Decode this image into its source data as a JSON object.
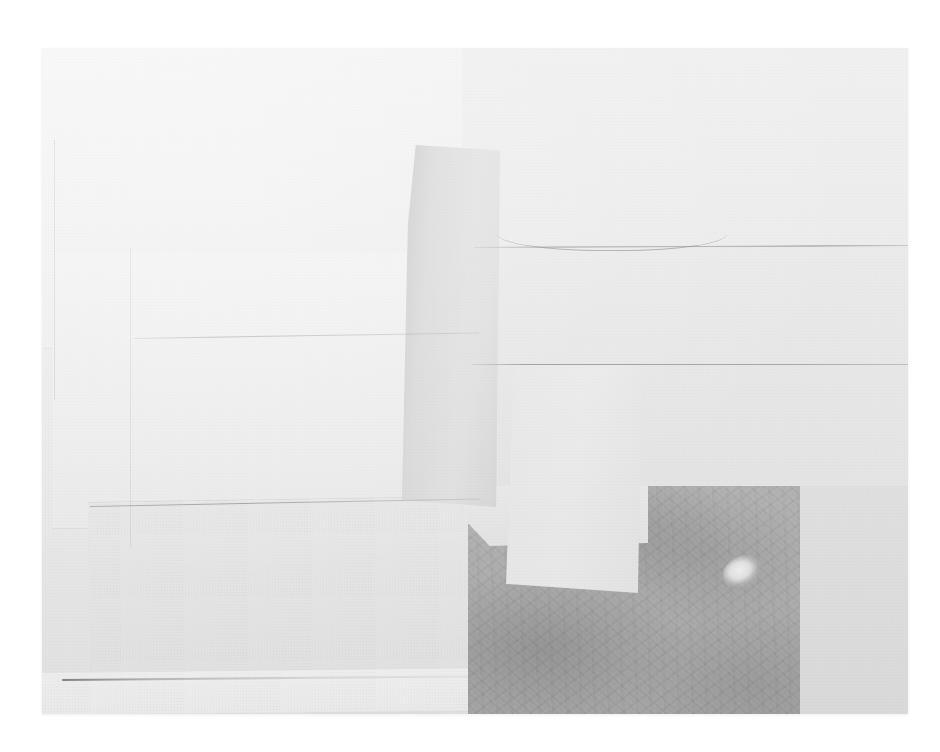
{
  "image": {
    "kind": "photograph-of-artwork",
    "subject": "abstract paper collage",
    "title": "",
    "caption": "",
    "visible_text": "",
    "background_color": "#ffffff",
    "plate": {
      "x": 42,
      "y": 48,
      "width": 866,
      "height": 666,
      "base_color": "#ebebeb"
    }
  },
  "palette": {
    "backdrop_white": "#ffffff",
    "paper_bright": "#f6f6f6",
    "paper_light": "#f0f0f0",
    "paper_mid": "#e7e7e7",
    "paper_warmgray": "#dcdcdc",
    "strip_gray": "#d8d8d8",
    "dark_field": "#b2b2b2",
    "crease_line": "#6e6e6e",
    "highlight_blob": "#f2f2f2"
  },
  "elements": [
    {
      "name": "sheet-upper-left",
      "label": "Large bright sheet, upper left",
      "tone": "#f4f4f4"
    },
    {
      "name": "sheet-mid-left",
      "label": "Bright sheet, middle left",
      "tone": "#f0f0f0"
    },
    {
      "name": "sheet-lower-left",
      "label": "Tilted sheet, lower left",
      "tone": "#e7e7e7"
    },
    {
      "name": "strip-bottom",
      "label": "Thin pale strip along the bottom edge",
      "tone": "#f1f1f1"
    },
    {
      "name": "sheet-upper-right",
      "label": "Wide sheet, upper right",
      "tone": "#ededed"
    },
    {
      "name": "sheet-right-band",
      "label": "Horizontal band between creases",
      "tone": "#e9e9e9"
    },
    {
      "name": "sheet-right-lower",
      "label": "Large field, lower right",
      "tone": "#e5e5e5"
    },
    {
      "name": "strip-tall",
      "label": "Tall tapered gray strip, center",
      "tone": "#dcdcdc"
    },
    {
      "name": "panel-vert",
      "label": "Light vertical panel over dark field",
      "tone": "#eaeaea"
    },
    {
      "name": "dark-rect",
      "label": "Dark textured rectangle, lower right",
      "tone": "#b2b2b2"
    },
    {
      "name": "light-blob",
      "label": "Pale irregular highlight inside dark field",
      "tone": "#f2f2f2"
    },
    {
      "name": "notch-sheet",
      "label": "Notched pale sheet over dark field",
      "tone": "#e8e8e8"
    },
    {
      "name": "right-field",
      "label": "Gray field right of the dark rectangle",
      "tone": "#e0e0e0"
    }
  ],
  "creases": [
    {
      "name": "crease-top",
      "label": "Upper horizontal crease with a gentle rise"
    },
    {
      "name": "crease-mid",
      "label": "Middle horizontal crease, right half"
    },
    {
      "name": "crease-left-mid",
      "label": "Faint angled crease, left middle"
    },
    {
      "name": "crease-lower-left",
      "label": "Crease above the lower-left sheet"
    },
    {
      "name": "crease-bottom-strip",
      "label": "Dark hairline above the bottom strip"
    },
    {
      "name": "seam-left-a",
      "label": "Faint vertical seam, far left"
    },
    {
      "name": "seam-left-b",
      "label": "Faint vertical seam, left of center"
    }
  ]
}
